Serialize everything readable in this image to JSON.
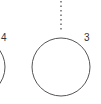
{
  "diagram": {
    "nodes": [
      {
        "id": "node-4",
        "label": "4",
        "cx": -24,
        "cy": 67,
        "r": 29,
        "label_x": 1,
        "label_y": 41
      },
      {
        "id": "node-3",
        "label": "3",
        "cx": 61,
        "cy": 67,
        "r": 29,
        "label_x": 84,
        "label_y": 41
      }
    ],
    "connectors": [
      {
        "id": "dotted-connector",
        "style": "dotted",
        "x": 61,
        "y1": 0,
        "y2": 32,
        "target": "node-3"
      }
    ],
    "colors": {
      "stroke": "#555555",
      "label": "#333333",
      "background": "#ffffff"
    }
  }
}
